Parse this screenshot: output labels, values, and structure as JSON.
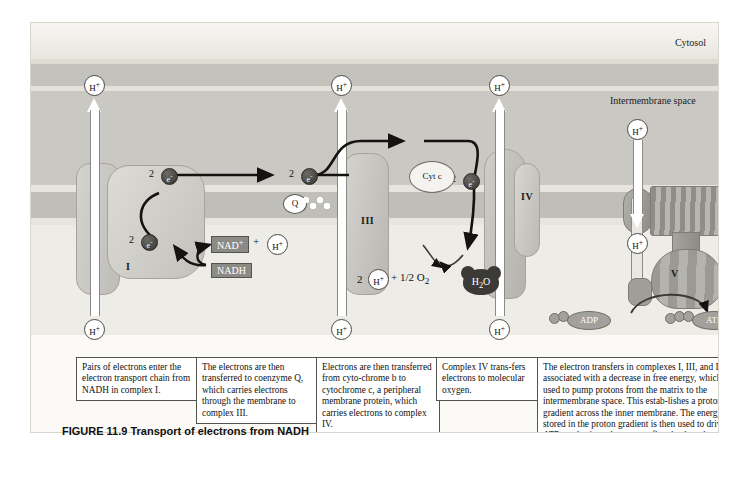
{
  "figure": {
    "title": "FIGURE 11.9 Transport of electrons from NADH",
    "title_number": "FIGURE 11.9",
    "title_text": "Transport of electrons from NADH"
  },
  "regions": {
    "cytosol": "Cytosol",
    "intermembrane_space": "Intermembrane space",
    "matrix": "Matrix"
  },
  "complexes": {
    "one": "I",
    "three": "III",
    "four": "IV",
    "five": "V"
  },
  "molecules": {
    "nad_plus": "NAD",
    "nad_plus_sup": "+",
    "plus_sign": "+",
    "h_plus": "H",
    "h_plus_sup": "+",
    "nadh": "NADH",
    "coenzyme_q": "Q",
    "cytochrome_c": "Cyt c",
    "water": "H",
    "water_sub": "2",
    "water_o": "O",
    "oxygen_expr": "+ 1/2 O",
    "oxygen_sub": "2",
    "two_h_prefix": "2",
    "adp": "ADP",
    "atp": "ATP"
  },
  "electrons": {
    "count_label": "2",
    "symbol": "e",
    "symbol_sup": "-"
  },
  "captions": [
    "Pairs of electrons enter the electron transport chain from NADH in complex I.",
    "The electrons are then transferred to coenzyme Q, which carries electrons through the membrane to complex III.",
    "Electrons are then transferred from cyto-chrome b to cytochrome c, a peripheral membrane protein, which carries electrons to complex IV.",
    "Complex IV trans-fers electrons to molecular oxygen.",
    "The electron transfers in complexes I, III, and IV are associated with a decrease in free energy, which is used to pump protons from the matrix to the intermembrane space. This estab-lishes a proton gradient across the inner membrane. The energy stored in the proton gradient is then used to drive ATP synthesis as the protons flow back to the matrix through complex V."
  ],
  "colors": {
    "panel_background": "#f2f0ea",
    "membrane": "#bfbeb9",
    "intermembrane": "#c9c8c3",
    "matrix": "#eeece6",
    "complex_fill": "#c8c6c0",
    "electron_dot": "#35332f",
    "label_box": "#8c8a85"
  }
}
